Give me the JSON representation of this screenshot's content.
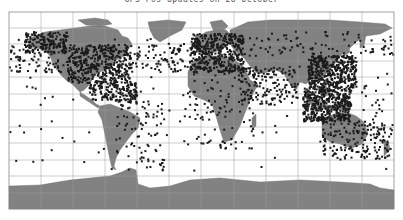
{
  "title": "GPS Pos Updates on 28 October",
  "colors": {
    "ocean": "#ffffff",
    "land": "#828282",
    "grid": "#9a9a9a",
    "frame": "#8a8a8a",
    "point": "#1a1a1a"
  },
  "map": {
    "projection": "equirectangular",
    "frame": {
      "x0": 9,
      "y0": 12,
      "x1": 394,
      "y1": 209
    },
    "lon_range": [
      -180,
      180
    ],
    "lat_range": [
      -90,
      90
    ],
    "grid_lon_step": 30,
    "grid_lat_step": 15
  },
  "chart_data": {
    "type": "scatter",
    "title": "GPS Pos Updates on 28 October",
    "xlabel": "Longitude",
    "ylabel": "Latitude",
    "xlim": [
      -180,
      180
    ],
    "ylim": [
      -90,
      90
    ],
    "grid": true,
    "legend": null,
    "clusters": [
      {
        "region": "North America (dense)",
        "lon_range": [
          -125,
          -65
        ],
        "lat_range": [
          25,
          60
        ],
        "density": "very high"
      },
      {
        "region": "Alaska / NW Canada",
        "lon_range": [
          -165,
          -125
        ],
        "lat_range": [
          52,
          72
        ],
        "density": "high"
      },
      {
        "region": "North Pacific track lines",
        "lon_range": [
          -180,
          -125
        ],
        "lat_range": [
          35,
          60
        ],
        "density": "medium"
      },
      {
        "region": "North Atlantic routes",
        "lon_range": [
          -65,
          -10
        ],
        "lat_range": [
          35,
          62
        ],
        "density": "medium"
      },
      {
        "region": "Europe (dense)",
        "lon_range": [
          -10,
          40
        ],
        "lat_range": [
          35,
          70
        ],
        "density": "very high"
      },
      {
        "region": "Central America / Caribbean",
        "lon_range": [
          -105,
          -60
        ],
        "lat_range": [
          8,
          25
        ],
        "density": "high"
      },
      {
        "region": "South America",
        "lon_range": [
          -80,
          -35
        ],
        "lat_range": [
          -55,
          10
        ],
        "density": "medium"
      },
      {
        "region": "Africa",
        "lon_range": [
          -17,
          50
        ],
        "lat_range": [
          -35,
          35
        ],
        "density": "medium"
      },
      {
        "region": "Middle East / India",
        "lon_range": [
          35,
          90
        ],
        "lat_range": [
          5,
          40
        ],
        "density": "high"
      },
      {
        "region": "East Asia (dense)",
        "lon_range": [
          100,
          145
        ],
        "lat_range": [
          20,
          50
        ],
        "density": "very high"
      },
      {
        "region": "Southeast Asia / Indonesia",
        "lon_range": [
          95,
          140
        ],
        "lat_range": [
          -10,
          20
        ],
        "density": "very high"
      },
      {
        "region": "Australia / NZ",
        "lon_range": [
          113,
          178
        ],
        "lat_range": [
          -45,
          -10
        ],
        "density": "high"
      },
      {
        "region": "Russia / Siberia",
        "lon_range": [
          40,
          180
        ],
        "lat_range": [
          50,
          72
        ],
        "density": "medium"
      },
      {
        "region": "Pacific islands",
        "lon_range": [
          150,
          180
        ],
        "lat_range": [
          -25,
          25
        ],
        "density": "low"
      },
      {
        "region": "Scattered ocean",
        "lon_range": [
          -180,
          180
        ],
        "lat_range": [
          -60,
          70
        ],
        "density": "sparse"
      }
    ],
    "sample_points": [
      [
        -120,
        48
      ],
      [
        -118,
        34
      ],
      [
        -112,
        40
      ],
      [
        -105,
        39
      ],
      [
        -100,
        45
      ],
      [
        -97,
        32
      ],
      [
        -95,
        30
      ],
      [
        -90,
        38
      ],
      [
        -87,
        42
      ],
      [
        -84,
        34
      ],
      [
        -80,
        26
      ],
      [
        -77,
        39
      ],
      [
        -75,
        41
      ],
      [
        -73,
        45
      ],
      [
        -71,
        42
      ],
      [
        -79,
        44
      ],
      [
        -123,
        45
      ],
      [
        -122,
        37
      ],
      [
        -115,
        36
      ],
      [
        -150,
        61
      ],
      [
        -147,
        64
      ],
      [
        -135,
        58
      ],
      [
        -160,
        57
      ],
      [
        -170,
        55
      ],
      [
        -175,
        52
      ],
      [
        -155,
        20
      ],
      [
        -158,
        21
      ],
      [
        -60,
        50
      ],
      [
        -50,
        48
      ],
      [
        -40,
        45
      ],
      [
        -30,
        40
      ],
      [
        -20,
        55
      ],
      [
        -25,
        38
      ],
      [
        -99,
        19
      ],
      [
        -90,
        15
      ],
      [
        -85,
        12
      ],
      [
        -80,
        9
      ],
      [
        -70,
        18
      ],
      [
        -66,
        18
      ],
      [
        -62,
        14
      ],
      [
        -74,
        4
      ],
      [
        -77,
        -12
      ],
      [
        -70,
        -33
      ],
      [
        -58,
        -34
      ],
      [
        -47,
        -23
      ],
      [
        -43,
        -22
      ],
      [
        -38,
        -12
      ],
      [
        -35,
        -8
      ],
      [
        -60,
        -3
      ],
      [
        -65,
        -17
      ],
      [
        -68,
        -54
      ],
      [
        -9,
        38
      ],
      [
        -3,
        40
      ],
      [
        2,
        48
      ],
      [
        0,
        51
      ],
      [
        4,
        52
      ],
      [
        10,
        53
      ],
      [
        13,
        52
      ],
      [
        18,
        59
      ],
      [
        24,
        60
      ],
      [
        10,
        60
      ],
      [
        30,
        59
      ],
      [
        37,
        55
      ],
      [
        14,
        45
      ],
      [
        12,
        42
      ],
      [
        23,
        38
      ],
      [
        28,
        41
      ],
      [
        -8,
        53
      ],
      [
        -4,
        56
      ],
      [
        -17,
        14
      ],
      [
        -4,
        5
      ],
      [
        3,
        6
      ],
      [
        7,
        9
      ],
      [
        15,
        -4
      ],
      [
        18,
        -34
      ],
      [
        28,
        -26
      ],
      [
        32,
        -29
      ],
      [
        36,
        -1
      ],
      [
        38,
        9
      ],
      [
        31,
        30
      ],
      [
        45,
        2
      ],
      [
        47,
        -19
      ],
      [
        13,
        32
      ],
      [
        -7,
        33
      ],
      [
        35,
        32
      ],
      [
        44,
        33
      ],
      [
        51,
        25
      ],
      [
        55,
        25
      ],
      [
        67,
        25
      ],
      [
        73,
        19
      ],
      [
        77,
        28
      ],
      [
        80,
        13
      ],
      [
        88,
        22
      ],
      [
        90,
        24
      ],
      [
        100,
        14
      ],
      [
        103,
        1
      ],
      [
        106,
        -6
      ],
      [
        107,
        10
      ],
      [
        110,
        -7
      ],
      [
        115,
        -8
      ],
      [
        120,
        14
      ],
      [
        121,
        31
      ],
      [
        116,
        40
      ],
      [
        113,
        23
      ],
      [
        121,
        25
      ],
      [
        127,
        37
      ],
      [
        130,
        33
      ],
      [
        135,
        35
      ],
      [
        140,
        36
      ],
      [
        141,
        43
      ],
      [
        125,
        7
      ],
      [
        115,
        -32
      ],
      [
        138,
        -35
      ],
      [
        145,
        -38
      ],
      [
        151,
        -34
      ],
      [
        153,
        -27
      ],
      [
        147,
        -19
      ],
      [
        131,
        -12
      ],
      [
        174,
        -37
      ],
      [
        172,
        -43
      ],
      [
        178,
        -18
      ],
      [
        166,
        -22
      ],
      [
        60,
        56
      ],
      [
        73,
        55
      ],
      [
        83,
        55
      ],
      [
        104,
        52
      ],
      [
        131,
        43
      ],
      [
        135,
        48
      ],
      [
        158,
        53
      ],
      [
        177,
        64
      ],
      [
        -140,
        -10
      ],
      [
        -130,
        -25
      ],
      [
        -150,
        -17
      ],
      [
        -170,
        -14
      ],
      [
        -105,
        -20
      ],
      [
        -120,
        10
      ],
      [
        -45,
        20
      ],
      [
        -30,
        0
      ],
      [
        -20,
        -10
      ],
      [
        0,
        -30
      ],
      [
        70,
        -20
      ],
      [
        80,
        -5
      ],
      [
        57,
        -20
      ],
      [
        170,
        10
      ],
      [
        165,
        30
      ],
      [
        -160,
        30
      ],
      [
        -140,
        35
      ]
    ]
  }
}
